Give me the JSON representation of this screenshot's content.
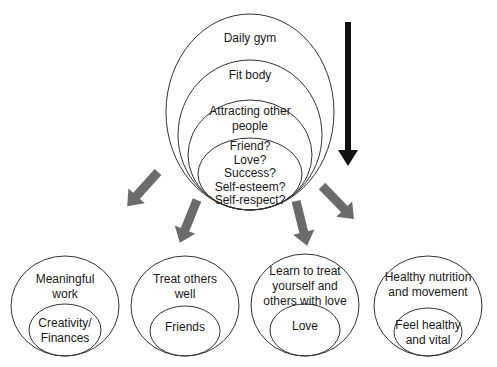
{
  "diagram": {
    "top_cluster": {
      "circles": [
        {
          "label_lines": [
            "Daily gym"
          ]
        },
        {
          "label_lines": [
            "Fit body"
          ]
        },
        {
          "label_lines": [
            "Attracting other",
            "people"
          ]
        },
        {
          "label_lines": [
            "Friend?",
            "Love?",
            "Success?",
            "Self-esteem?",
            "Self-respect?"
          ]
        }
      ]
    },
    "main_arrow": {
      "direction": "down",
      "color": "#111111"
    },
    "branch_arrows": {
      "count": 5,
      "color": "#6b6b6b"
    },
    "bottom_clusters": [
      {
        "outer_lines": [
          "Meaningful",
          "work"
        ],
        "inner_lines": [
          "Creativity/",
          "Finances"
        ]
      },
      {
        "outer_lines": [
          "Treat others",
          "well"
        ],
        "inner_lines": [
          "Friends"
        ]
      },
      {
        "outer_lines": [
          "Learn to treat",
          "yourself and",
          "others with love"
        ],
        "inner_lines": [
          "Love"
        ]
      },
      {
        "outer_lines": [
          "Healthy nutrition",
          "and movement"
        ],
        "inner_lines": [
          "Feel healthy",
          "and vital"
        ]
      }
    ]
  }
}
